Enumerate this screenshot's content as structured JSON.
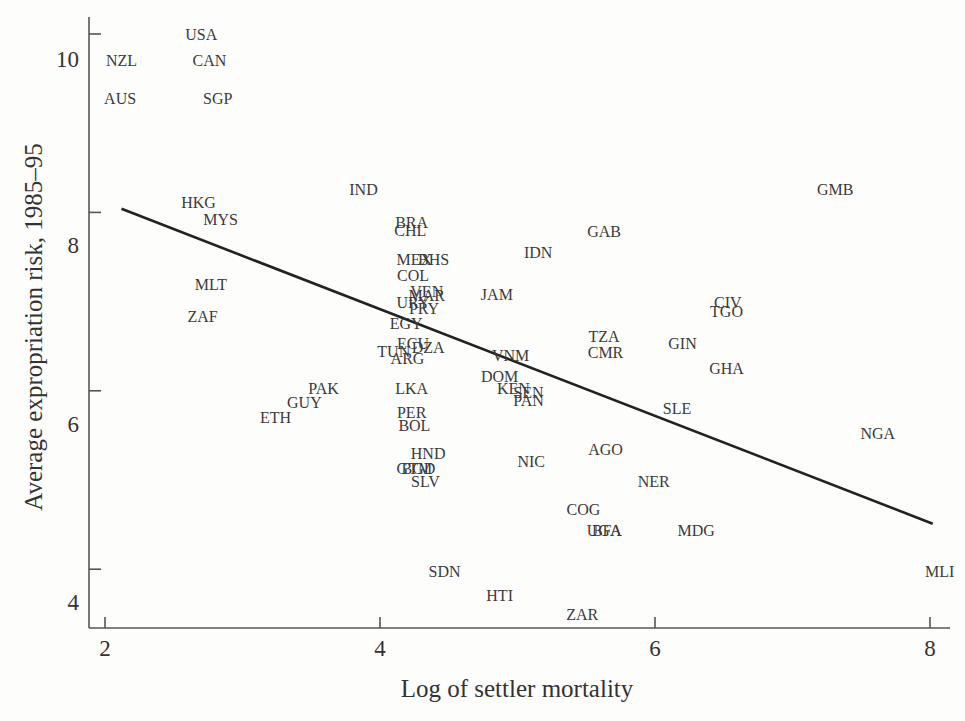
{
  "chart_data": {
    "type": "scatter",
    "title": "",
    "xlabel": "Log of settler mortality",
    "ylabel": "Average expropriation risk, 1985–95",
    "xlim": [
      1.9,
      8.2
    ],
    "ylim": [
      3.35,
      10.3
    ],
    "x_ticks": [
      2,
      4,
      6,
      8
    ],
    "x_tick_labels": [
      "2",
      "4",
      "6",
      "8"
    ],
    "y_ticks": [
      4,
      6,
      8,
      10
    ],
    "y_tick_labels": [
      "4",
      "6",
      "8",
      "10"
    ],
    "grid": false,
    "legend": null,
    "marker": "country-code-text",
    "fit_line": {
      "x": [
        2.12,
        8.02
      ],
      "y": [
        8.04,
        4.51
      ]
    },
    "points": [
      {
        "label": "USA",
        "x": 2.7,
        "y": 10.0
      },
      {
        "label": "NZL",
        "x": 2.12,
        "y": 9.71
      },
      {
        "label": "CAN",
        "x": 2.76,
        "y": 9.71
      },
      {
        "label": "AUS",
        "x": 2.11,
        "y": 9.28
      },
      {
        "label": "SGP",
        "x": 2.82,
        "y": 9.28
      },
      {
        "label": "HKG",
        "x": 2.68,
        "y": 8.12
      },
      {
        "label": "MYS",
        "x": 2.84,
        "y": 7.93
      },
      {
        "label": "IND",
        "x": 3.88,
        "y": 8.26
      },
      {
        "label": "GMB",
        "x": 7.31,
        "y": 8.26
      },
      {
        "label": "BRA",
        "x": 4.23,
        "y": 7.89
      },
      {
        "label": "CHL",
        "x": 4.22,
        "y": 7.8
      },
      {
        "label": "GAB",
        "x": 5.63,
        "y": 7.79
      },
      {
        "label": "IDN",
        "x": 5.15,
        "y": 7.56
      },
      {
        "label": "MEX",
        "x": 4.25,
        "y": 7.48
      },
      {
        "label": "BHS",
        "x": 4.39,
        "y": 7.48
      },
      {
        "label": "COL",
        "x": 4.24,
        "y": 7.3
      },
      {
        "label": "MLT",
        "x": 2.77,
        "y": 7.2
      },
      {
        "label": "VEN",
        "x": 4.34,
        "y": 7.12
      },
      {
        "label": "MAR",
        "x": 4.34,
        "y": 7.07
      },
      {
        "label": "JAM",
        "x": 4.85,
        "y": 7.08
      },
      {
        "label": "URY",
        "x": 4.24,
        "y": 7.0
      },
      {
        "label": "PRY",
        "x": 4.32,
        "y": 6.93
      },
      {
        "label": "CIV",
        "x": 6.53,
        "y": 7.0
      },
      {
        "label": "TGO",
        "x": 6.52,
        "y": 6.89
      },
      {
        "label": "ZAF",
        "x": 2.71,
        "y": 6.84
      },
      {
        "label": "EGY",
        "x": 4.19,
        "y": 6.76
      },
      {
        "label": "TZA",
        "x": 5.63,
        "y": 6.61
      },
      {
        "label": "ECU",
        "x": 4.24,
        "y": 6.54
      },
      {
        "label": "DZA",
        "x": 4.35,
        "y": 6.49
      },
      {
        "label": "TUN",
        "x": 4.1,
        "y": 6.45
      },
      {
        "label": "GIN",
        "x": 6.2,
        "y": 6.54
      },
      {
        "label": "CMR",
        "x": 5.64,
        "y": 6.44
      },
      {
        "label": "ARG",
        "x": 4.2,
        "y": 6.37
      },
      {
        "label": "VNM",
        "x": 4.95,
        "y": 6.4
      },
      {
        "label": "GHA",
        "x": 6.52,
        "y": 6.26
      },
      {
        "label": "DOM",
        "x": 4.87,
        "y": 6.17
      },
      {
        "label": "PAK",
        "x": 3.59,
        "y": 6.03
      },
      {
        "label": "LKA",
        "x": 4.23,
        "y": 6.03
      },
      {
        "label": "KEN",
        "x": 4.97,
        "y": 6.03
      },
      {
        "label": "SEN",
        "x": 5.08,
        "y": 5.99
      },
      {
        "label": "PAN",
        "x": 5.08,
        "y": 5.9
      },
      {
        "label": "GUY",
        "x": 3.45,
        "y": 5.88
      },
      {
        "label": "SLE",
        "x": 6.16,
        "y": 5.81
      },
      {
        "label": "ETH",
        "x": 3.24,
        "y": 5.71
      },
      {
        "label": "PER",
        "x": 4.23,
        "y": 5.76
      },
      {
        "label": "BOL",
        "x": 4.25,
        "y": 5.62
      },
      {
        "label": "NGA",
        "x": 7.62,
        "y": 5.53
      },
      {
        "label": "AGO",
        "x": 5.64,
        "y": 5.35
      },
      {
        "label": "HND",
        "x": 4.35,
        "y": 5.3
      },
      {
        "label": "NIC",
        "x": 5.1,
        "y": 5.21
      },
      {
        "label": "GTM",
        "x": 4.25,
        "y": 5.14
      },
      {
        "label": "BGD",
        "x": 4.28,
        "y": 5.14
      },
      {
        "label": "SLV",
        "x": 4.33,
        "y": 4.99
      },
      {
        "label": "NER",
        "x": 5.99,
        "y": 4.99
      },
      {
        "label": "COG",
        "x": 5.48,
        "y": 4.67
      },
      {
        "label": "UGA",
        "x": 5.63,
        "y": 4.44
      },
      {
        "label": "BFA",
        "x": 5.65,
        "y": 4.44
      },
      {
        "label": "MDG",
        "x": 6.3,
        "y": 4.44
      },
      {
        "label": "SDN",
        "x": 4.47,
        "y": 3.98
      },
      {
        "label": "MLI",
        "x": 8.07,
        "y": 3.98
      },
      {
        "label": "HTI",
        "x": 4.87,
        "y": 3.71
      },
      {
        "label": "ZAR",
        "x": 5.47,
        "y": 3.5
      }
    ]
  },
  "colors": {
    "background": "#fdfdfc",
    "text": "#3a3a3a",
    "axis": "#555555",
    "fit_line": "#222222"
  }
}
